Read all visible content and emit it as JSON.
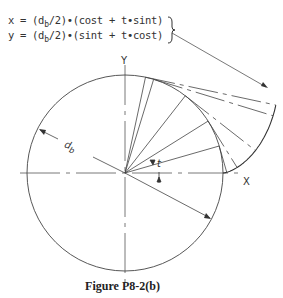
{
  "equations": {
    "x": {
      "prefix": "x = (d",
      "sub": "b",
      "suffix": "/2)•(cost + t•sint)"
    },
    "y": {
      "prefix": "y = (d",
      "sub": "b",
      "suffix": "/2)•(sint + t•cost)"
    }
  },
  "labels": {
    "y_axis": "Y",
    "x_axis": "X",
    "angle": "t",
    "diameter": "d",
    "diameter_sub": "b"
  },
  "caption": "Figure P8-2(b)",
  "geometry": {
    "center": [
      125,
      173
    ],
    "radius": 98,
    "involute_t_max": 1.36,
    "construction_angles_deg": [
      16,
      32,
      52,
      73
    ],
    "line_color": "#333333"
  }
}
